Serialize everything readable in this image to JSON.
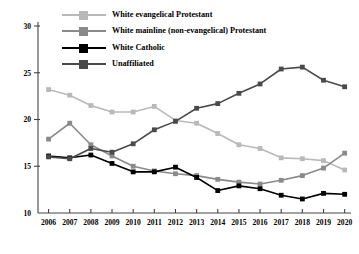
{
  "chart_data": {
    "type": "line",
    "title": "",
    "xlabel": "",
    "ylabel": "",
    "grid": false,
    "legend_position": "top-left-inside",
    "categories": [
      2006,
      2007,
      2008,
      2009,
      2010,
      2011,
      2012,
      2013,
      2014,
      2015,
      2016,
      2017,
      2018,
      2019,
      2020
    ],
    "x_tick_labels": [
      "2006",
      "2007",
      "2008",
      "2009",
      "2010",
      "2011",
      "2012",
      "2013",
      "2014",
      "2015",
      "2016",
      "2017",
      "2018",
      "2019",
      "2020"
    ],
    "y_tick_labels": [
      "10",
      "15",
      "20",
      "25",
      "30"
    ],
    "y_ticks": [
      10,
      15,
      20,
      25,
      30
    ],
    "xlim": [
      2005.5,
      2020.3
    ],
    "ylim": [
      10,
      30
    ],
    "series": [
      {
        "name": "White evangelical Protestant",
        "color": "#b9b9b9",
        "marker": "square",
        "values": [
          23.2,
          22.6,
          21.5,
          20.8,
          20.8,
          21.4,
          19.9,
          19.6,
          18.5,
          17.3,
          16.9,
          15.9,
          15.8,
          15.6,
          14.6
        ]
      },
      {
        "name": "White mainline (non-evangelical) Protestant",
        "color": "#8a8a8a",
        "marker": "square",
        "values": [
          17.9,
          19.6,
          17.3,
          16.1,
          15.0,
          14.5,
          14.2,
          14.0,
          13.6,
          13.3,
          13.1,
          13.5,
          14.0,
          14.8,
          16.4
        ]
      },
      {
        "name": "White Catholic",
        "color": "#000000",
        "marker": "square",
        "values": [
          16.1,
          15.9,
          16.2,
          15.3,
          14.4,
          14.4,
          14.9,
          13.8,
          12.4,
          12.9,
          12.6,
          11.9,
          11.5,
          12.1,
          12.0
        ]
      },
      {
        "name": "Unaffiliated",
        "color": "#4a4a4a",
        "marker": "square",
        "values": [
          16.0,
          15.8,
          16.9,
          16.5,
          17.4,
          18.9,
          19.8,
          21.2,
          21.7,
          22.8,
          23.8,
          25.4,
          25.6,
          24.2,
          23.5
        ]
      }
    ]
  }
}
